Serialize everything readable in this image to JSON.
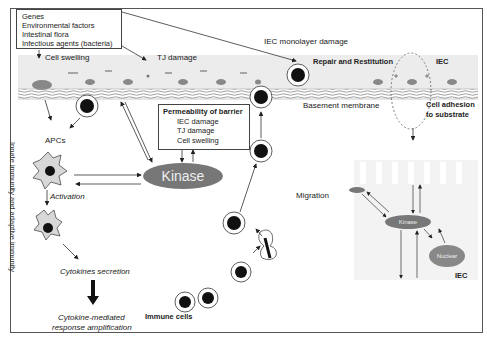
{
  "factors_box": {
    "lines": [
      "Genes",
      "Environmental factors",
      "Intestinal flora",
      "Infectious agents (bacteria)"
    ]
  },
  "labels": {
    "cell_swelling": "Cell swelling",
    "tj_damage": "TJ damage",
    "iec_monolayer_damage": "IEC monolayer damage",
    "repair_restitution": "Repair and Restitution",
    "iec_top": "IEC",
    "basement_membrane": "Basement membrane",
    "cell_adhesion_line1": "Cell adhesion",
    "cell_adhesion_line2": "to substrate",
    "apcs": "APCs",
    "activation": "Activation",
    "cytokines_secretion": "Cytokines secretion",
    "cytokine_response_line1": "Cytokine-mediated",
    "cytokine_response_line2": "response amplification",
    "immune_cells": "Immune cells",
    "migration": "Migration",
    "innate_vertical": "Innate immunity and adaptive immunity",
    "iec_bottom": "IEC"
  },
  "permeability_box": {
    "title": "Permeability of barrier",
    "items": [
      "IEC damage",
      "TJ damage",
      "Cell swelling"
    ]
  },
  "nodes": {
    "kinase_main": "Kinase",
    "kinase_small": "Kinase",
    "nuclear": "Nuclear"
  },
  "colors": {
    "kinase": "#777777",
    "nucleus": "#111111",
    "apc_fill": "#d8d8d8",
    "epithelium_band": "#ececec",
    "iec_nucleus": "#888888"
  }
}
